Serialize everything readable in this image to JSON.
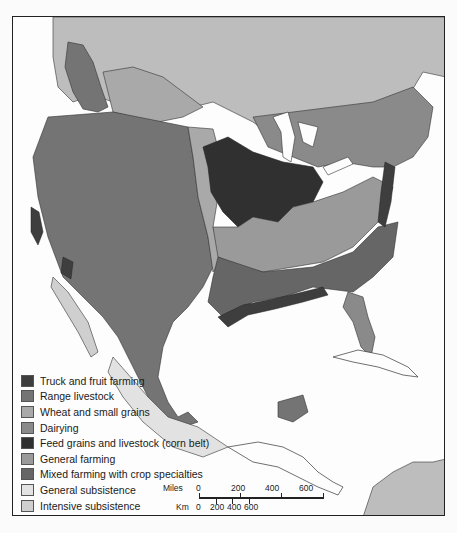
{
  "map": {
    "type": "thematic agricultural regions map",
    "region": "North America and Central America",
    "colors": {
      "ocean": "#fdfdfd",
      "border": "#222222",
      "truck_fruit": "#3e3e3e",
      "range_livestock": "#747474",
      "wheat_grains": "#a9a9a9",
      "dairying": "#8a8a8a",
      "corn_belt": "#303030",
      "general_farming": "#9a9a9a",
      "mixed_farming": "#666666",
      "general_subsistence": "#e2e2e2",
      "intensive_subsistence": "#cfcfcf",
      "nonfarming": "#bdbdbd"
    }
  },
  "legend": {
    "items": [
      {
        "label": "Truck and fruit farming",
        "color": "#3e3e3e"
      },
      {
        "label": "Range livestock",
        "color": "#747474"
      },
      {
        "label": "Wheat and small grains",
        "color": "#a9a9a9"
      },
      {
        "label": "Dairying",
        "color": "#8a8a8a"
      },
      {
        "label": "Feed grains and livestock (corn belt)",
        "color": "#303030"
      },
      {
        "label": "General farming",
        "color": "#9a9a9a"
      },
      {
        "label": "Mixed farming with crop specialties",
        "color": "#666666"
      },
      {
        "label": "General subsistence",
        "color": "#e2e2e2"
      },
      {
        "label": "Intensive subsistence",
        "color": "#cfcfcf"
      },
      {
        "label": "Nonfarming",
        "color": "#bdbdbd"
      }
    ]
  },
  "scale": {
    "miles_label": "Miles",
    "km_label": "Km",
    "miles_ticks": [
      "0",
      "200",
      "400",
      "600"
    ],
    "km_ticks": [
      "0",
      "200",
      "400",
      "600"
    ]
  }
}
